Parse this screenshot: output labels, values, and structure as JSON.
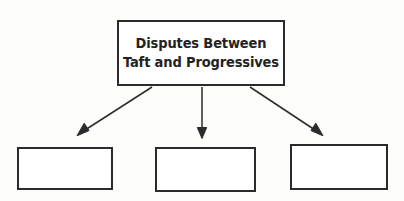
{
  "diagram": {
    "type": "hierarchy-flowchart",
    "orientation": "top-down",
    "background_color": "#fdfdfc",
    "line_color": "#2b2b2b",
    "text_color": "#232323",
    "root": {
      "label_line_1": "Disputes Between",
      "label_line_2": "Taft and Progressives",
      "full_label": "Disputes Between Taft and Progressives"
    },
    "children": [
      {
        "label": "",
        "empty": true
      },
      {
        "label": "",
        "empty": true
      },
      {
        "label": "",
        "empty": true
      }
    ],
    "connectors": [
      {
        "name": "arrow-left",
        "direction": "down-left"
      },
      {
        "name": "arrow-center",
        "direction": "down"
      },
      {
        "name": "arrow-right",
        "direction": "down-right"
      }
    ]
  }
}
